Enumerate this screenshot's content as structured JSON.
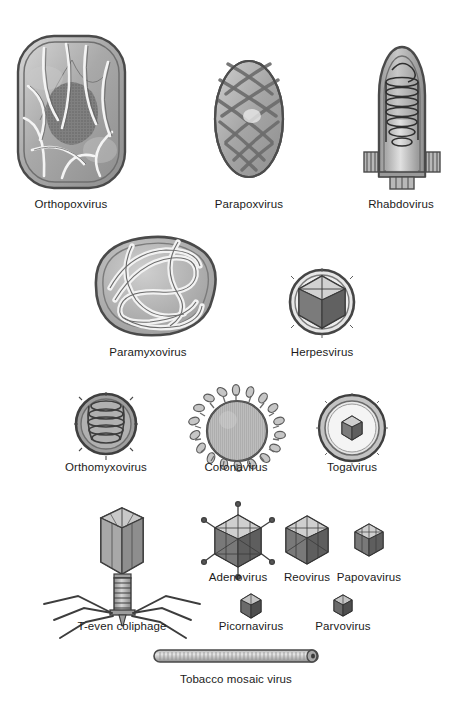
{
  "figure": {
    "background_color": "#ffffff",
    "ink_color": "#2b2b2b",
    "style": "grayscale scientific line illustration of virus morphologies"
  },
  "rows": [
    {
      "row_index": 1,
      "items": [
        {
          "name": "orthopoxvirus",
          "label": "Orthopoxvirus",
          "shape": "brick-rounded-rectangle",
          "cx": 71,
          "label_y": 198
        },
        {
          "name": "parapoxvirus",
          "label": "Parapoxvirus",
          "shape": "ovoid-criss-cross",
          "cx": 249,
          "label_y": 198
        },
        {
          "name": "rhabdovirus",
          "label": "Rhabdovirus",
          "shape": "bullet",
          "cx": 401,
          "label_y": 198
        }
      ]
    },
    {
      "row_index": 2,
      "items": [
        {
          "name": "paramyxovirus",
          "label": "Paramyxovirus",
          "shape": "pleomorphic-enveloped-helical",
          "cx": 148,
          "label_y": 346
        },
        {
          "name": "herpesvirus",
          "label": "Herpesvirus",
          "shape": "enveloped-icosahedral",
          "cx": 322,
          "label_y": 346
        }
      ]
    },
    {
      "row_index": 3,
      "items": [
        {
          "name": "orthomyxovirus",
          "label": "Orthomyxovirus",
          "shape": "spherical-helical-coil",
          "cx": 106,
          "label_y": 461
        },
        {
          "name": "coronavirus",
          "label": "Coronavirus",
          "shape": "spherical-peplomers",
          "cx": 236,
          "label_y": 461
        },
        {
          "name": "togavirus",
          "label": "Togavirus",
          "shape": "enveloped-small-core",
          "cx": 352,
          "label_y": 461
        }
      ]
    },
    {
      "row_index": 4,
      "items": [
        {
          "name": "t-even-coliphage",
          "label": "T-even coliphage",
          "shape": "bacteriophage",
          "cx": 122,
          "label_y": 620
        },
        {
          "name": "adenovirus",
          "label": "Adenovirus",
          "shape": "icosahedral-with-fibers",
          "cx": 238,
          "label_y": 571
        },
        {
          "name": "reovirus",
          "label": "Reovirus",
          "shape": "icosahedral",
          "cx": 307,
          "label_y": 571
        },
        {
          "name": "papovavirus",
          "label": "Papovavirus",
          "shape": "icosahedral-small",
          "cx": 369,
          "label_y": 571
        },
        {
          "name": "picornavirus",
          "label": "Picornavirus",
          "shape": "icosahedral-tiny",
          "cx": 251,
          "label_y": 620
        },
        {
          "name": "parvovirus",
          "label": "Parvovirus",
          "shape": "icosahedral-tiny",
          "cx": 343,
          "label_y": 620
        }
      ]
    },
    {
      "row_index": 5,
      "items": [
        {
          "name": "tobacco-mosaic-virus",
          "label": "Tobacco mosaic virus",
          "shape": "helical-rod",
          "cx": 236,
          "label_y": 673
        }
      ]
    }
  ]
}
